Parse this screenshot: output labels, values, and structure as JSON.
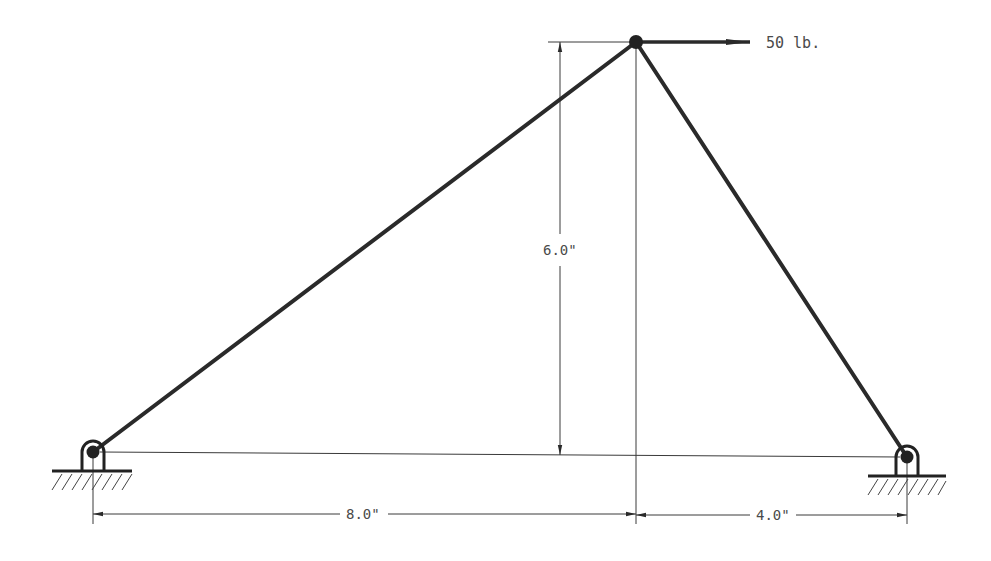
{
  "diagram": {
    "type": "truss-statics-problem",
    "load": {
      "label": "50 lb.",
      "direction": "right",
      "magnitude": 50,
      "unit": "lb"
    },
    "dimensions": {
      "height": "6.0\"",
      "left_span": "8.0\"",
      "right_span": "4.0\""
    },
    "joints": {
      "top": {
        "name": "apex",
        "x": 636,
        "y": 42
      },
      "left_support": {
        "name": "pin-left",
        "x": 93,
        "y": 452
      },
      "right_support": {
        "name": "pin-right",
        "x": 907,
        "y": 457
      }
    },
    "members": [
      {
        "name": "left-member",
        "from": "left_support",
        "to": "top"
      },
      {
        "name": "right-member",
        "from": "top",
        "to": "right_support"
      }
    ],
    "colors": {
      "member": "#2a2a2a",
      "line": "#3a3a3a",
      "text": "#4a4a4a",
      "background": "#ffffff"
    }
  }
}
